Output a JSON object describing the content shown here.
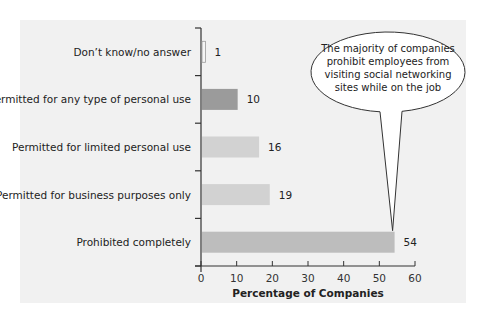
{
  "chart_data": {
    "type": "bar",
    "orientation": "horizontal",
    "title": "",
    "categories": [
      "Don’t know/no answer",
      "Permitted for any type of personal use",
      "Permitted for limited personal use",
      "Permitted for business purposes only",
      "Prohibited completely"
    ],
    "values": [
      1,
      10,
      16,
      19,
      54
    ],
    "bar_colors": [
      "#f4f4f4",
      "#9b9b9b",
      "#d2d2d2",
      "#d2d2d2",
      "#bdbdbd"
    ],
    "xlabel": "Percentage of Companies",
    "ylabel": "",
    "xlim": [
      0,
      60
    ],
    "xticks": [
      0,
      10,
      20,
      30,
      40,
      50,
      60
    ],
    "grid": false,
    "legend": null,
    "annotation": {
      "text_lines": [
        "The majority of companies",
        "prohibit employees from",
        "visiting social networking",
        "sites while on the job"
      ],
      "points_to": "Prohibited completely"
    }
  }
}
